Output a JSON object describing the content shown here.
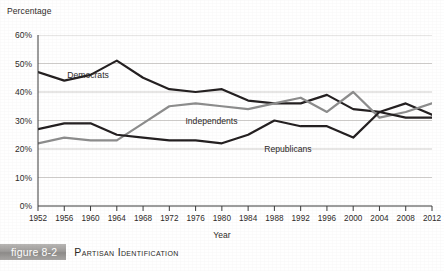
{
  "caption": {
    "badge_label": "figure 8-2",
    "title": "Partisan Identification"
  },
  "chart_data": {
    "type": "line",
    "title": "Partisan Identification",
    "xlabel": "Year",
    "ylabel": "Percentage",
    "xlim": [
      1952,
      2012
    ],
    "ylim": [
      0,
      60
    ],
    "grid": true,
    "legend_position": "inline-labels",
    "x": [
      1952,
      1956,
      1960,
      1964,
      1968,
      1972,
      1976,
      1980,
      1984,
      1988,
      1992,
      1996,
      2000,
      2004,
      2008,
      2012
    ],
    "categories": [
      "1952",
      "1956",
      "1960",
      "1964",
      "1968",
      "1972",
      "1976",
      "1980",
      "1984",
      "1988",
      "1992",
      "1996",
      "2000",
      "2004",
      "2008",
      "2012"
    ],
    "ytick_labels": [
      "0%",
      "10%",
      "20%",
      "30%",
      "40%",
      "50%",
      "60%"
    ],
    "ytick_values": [
      0,
      10,
      20,
      30,
      40,
      50,
      60
    ],
    "series": [
      {
        "name": "Democrats",
        "color": "#231f20",
        "values": [
          47,
          44,
          46,
          51,
          45,
          41,
          40,
          41,
          37,
          36,
          36,
          39,
          34,
          33,
          36,
          32
        ]
      },
      {
        "name": "Independents",
        "color": "#8c8c8c",
        "values": [
          22,
          24,
          23,
          23,
          29,
          35,
          36,
          35,
          34,
          36,
          38,
          33,
          40,
          31,
          33,
          36
        ]
      },
      {
        "name": "Republicans",
        "color": "#231f20",
        "values": [
          27,
          29,
          29,
          25,
          24,
          23,
          23,
          22,
          25,
          30,
          28,
          28,
          24,
          33,
          31,
          31
        ]
      }
    ],
    "annotations": [
      {
        "text": "Democrats",
        "x": 1956,
        "y": 46
      },
      {
        "text": "Independents",
        "x": 1974,
        "y": 30
      },
      {
        "text": "Republicans",
        "x": 1986,
        "y": 20
      }
    ]
  }
}
